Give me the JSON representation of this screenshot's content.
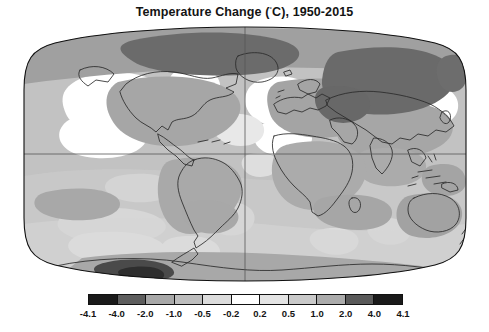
{
  "title": {
    "prefix": "Temperature Change (",
    "degree": "˚",
    "suffix": "C), 1950-2015",
    "full": "Temperature Change (˚C), 1950-2015"
  },
  "chart_data": {
    "type": "heatmap",
    "title": "Temperature Change (˚C), 1950-2015",
    "subtitle": "",
    "xlabel": "",
    "ylabel": "",
    "projection": "robinson",
    "grid": true,
    "graticule": {
      "equator_latitude": 0,
      "prime_meridian_longitude": 0
    },
    "legend_position": "bottom",
    "colorbar": {
      "orientation": "horizontal",
      "label": "",
      "units": "˚C",
      "extend": "both",
      "tick_labels": [
        "-4.1",
        "-4.0",
        "-2.0",
        "-1.0",
        "-0.5",
        "-0.2",
        "0.2",
        "0.5",
        "1.0",
        "2.0",
        "4.0",
        "4.1"
      ],
      "tick_values": [
        -4.1,
        -4.0,
        -2.0,
        -1.0,
        -0.5,
        -0.2,
        0.2,
        0.5,
        1.0,
        2.0,
        4.0,
        4.1
      ],
      "boundaries": [
        -4.1,
        -4.0,
        -2.0,
        -1.0,
        -0.5,
        -0.2,
        0.2,
        0.5,
        1.0,
        2.0,
        4.0,
        4.1
      ],
      "segments": [
        {
          "range": "-4.1 to -4.0",
          "color": "#1a1a1a"
        },
        {
          "range": "-4.0 to -2.0",
          "color": "#5e5e5e"
        },
        {
          "range": "-2.0 to -1.0",
          "color": "#a8a8a8"
        },
        {
          "range": "-1.0 to -0.5",
          "color": "#bdbdbd"
        },
        {
          "range": "-0.5 to -0.2",
          "color": "#dcdcdc"
        },
        {
          "range": "-0.2 to 0.2",
          "color": "#ffffff"
        },
        {
          "range": "0.2 to 0.5",
          "color": "#e4e4e4"
        },
        {
          "range": "0.5 to 1.0",
          "color": "#c9c9c9"
        },
        {
          "range": "1.0 to 2.0",
          "color": "#ababab"
        },
        {
          "range": "2.0 to 4.0",
          "color": "#5a5a5a"
        },
        {
          "range": "4.0 to 4.1",
          "color": "#1a1a1a"
        }
      ]
    },
    "value_range": [
      -4.1,
      4.1
    ],
    "regions": [
      {
        "name": "Arctic Canada / Greenland",
        "value_band": "2.0 to 4.0",
        "shade": "#6a6a6a"
      },
      {
        "name": "Siberia / Central Asia",
        "value_band": "2.0 to 4.0",
        "shade": "#6a6a6a"
      },
      {
        "name": "Northern North America",
        "value_band": "1.0 to 2.0",
        "shade": "#9c9c9c"
      },
      {
        "name": "North Atlantic cold blob",
        "value_band": "-0.2 to 0.2",
        "shade": "#ffffff"
      },
      {
        "name": "North Pacific",
        "value_band": "-0.2 to 0.2",
        "shade": "#ffffff"
      },
      {
        "name": "Europe",
        "value_band": "1.0 to 2.0",
        "shade": "#9c9c9c"
      },
      {
        "name": "Africa",
        "value_band": "0.5 to 1.0",
        "shade": "#b4b4b4"
      },
      {
        "name": "South America",
        "value_band": "0.5 to 1.0",
        "shade": "#b0b0b0"
      },
      {
        "name": "Australia",
        "value_band": "0.5 to 1.0",
        "shade": "#9f9f9f"
      },
      {
        "name": "Southern Ocean",
        "value_band": "0.2 to 0.5",
        "shade": "#d8d8d8"
      },
      {
        "name": "Antarctic Peninsula",
        "value_band": "2.0 to 4.0",
        "shade": "#6a6a6a"
      },
      {
        "name": "Tropical Pacific",
        "value_band": "0.2 to 0.5",
        "shade": "#d2d2d2"
      },
      {
        "name": "Indian Ocean",
        "value_band": "0.5 to 1.0",
        "shade": "#b8b8b8"
      }
    ]
  },
  "colors": {
    "background": "#ffffff",
    "frame": "#111111",
    "coastline": "#2b2b2b",
    "graticule": "#555555",
    "text": "#141414"
  }
}
